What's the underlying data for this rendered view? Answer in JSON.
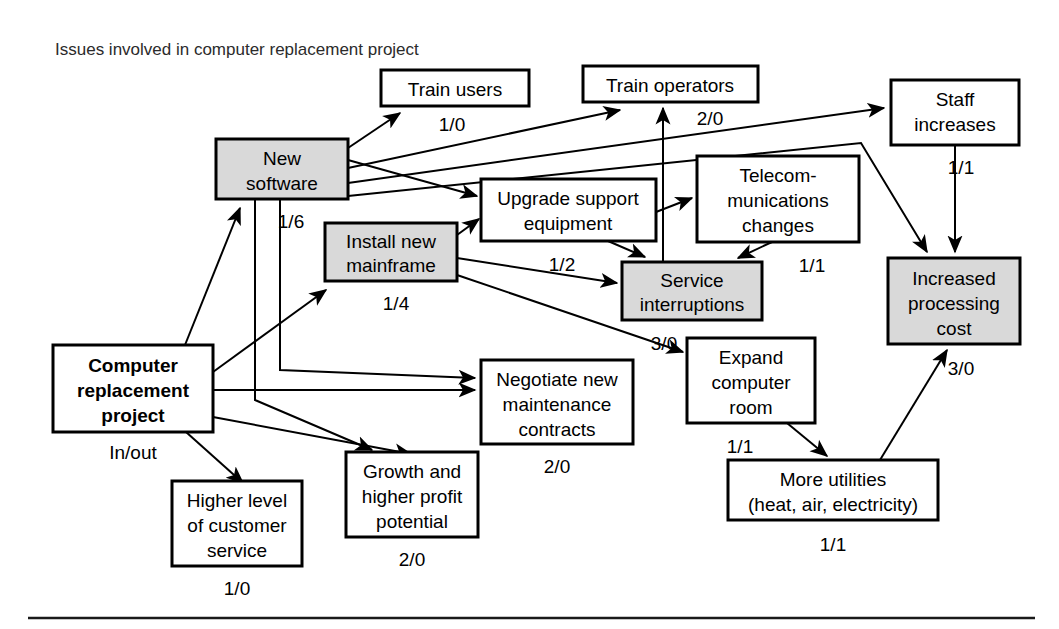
{
  "figure": {
    "title": "Issues involved in computer replacement project",
    "colors": {
      "shaded_fill": "#d9d9d9",
      "plain_fill": "#ffffff",
      "stroke": "#000000",
      "title_color": "#2b2b2b"
    }
  },
  "nodes": [
    {
      "id": "train-users",
      "lines": [
        "Train users"
      ],
      "io": "1/0",
      "shaded": false,
      "bold": false,
      "x": 381,
      "y": 70,
      "w": 148,
      "h": 36,
      "io_x": 452,
      "io_y": 131
    },
    {
      "id": "train-operators",
      "lines": [
        "Train operators"
      ],
      "io": "2/0",
      "shaded": false,
      "bold": false,
      "x": 583,
      "y": 66,
      "w": 175,
      "h": 36,
      "io_x": 710,
      "io_y": 125
    },
    {
      "id": "staff-increases",
      "lines": [
        "Staff",
        "increases"
      ],
      "io": "1/1",
      "shaded": false,
      "bold": false,
      "x": 891,
      "y": 80,
      "w": 128,
      "h": 65,
      "io_x": 961,
      "io_y": 174
    },
    {
      "id": "new-software",
      "lines": [
        "New",
        "software"
      ],
      "io": "1/6",
      "shaded": true,
      "bold": false,
      "x": 216,
      "y": 139,
      "w": 132,
      "h": 60,
      "io_x": 291,
      "io_y": 228
    },
    {
      "id": "upgrade-support-equipment",
      "lines": [
        "Upgrade support",
        "equipment"
      ],
      "io": "1/2",
      "shaded": false,
      "bold": false,
      "x": 481,
      "y": 179,
      "w": 175,
      "h": 62,
      "io_x": 562,
      "io_y": 271
    },
    {
      "id": "telecommunications-changes",
      "lines": [
        "Telecom-",
        "munications",
        "changes"
      ],
      "io": "1/1",
      "shaded": false,
      "bold": false,
      "x": 697,
      "y": 156,
      "w": 162,
      "h": 86,
      "io_x": 812,
      "io_y": 272
    },
    {
      "id": "install-new-mainframe",
      "lines": [
        "Install new",
        "mainframe"
      ],
      "io": "1/4",
      "shaded": true,
      "bold": false,
      "x": 325,
      "y": 223,
      "w": 132,
      "h": 58,
      "io_x": 396,
      "io_y": 310
    },
    {
      "id": "service-interruptions",
      "lines": [
        "Service",
        "interruptions"
      ],
      "io": "3/0",
      "shaded": true,
      "bold": false,
      "x": 622,
      "y": 262,
      "w": 140,
      "h": 58,
      "io_x": 664,
      "io_y": 350
    },
    {
      "id": "increased-processing-cost",
      "lines": [
        "Increased",
        "processing",
        "cost"
      ],
      "io": "3/0",
      "shaded": true,
      "bold": false,
      "x": 888,
      "y": 258,
      "w": 132,
      "h": 86,
      "io_x": 961,
      "io_y": 375
    },
    {
      "id": "computer-replacement-project",
      "lines": [
        "Computer",
        "replacement",
        "project"
      ],
      "io": "In/out",
      "shaded": false,
      "bold": true,
      "x": 53,
      "y": 345,
      "w": 160,
      "h": 87,
      "io_x": 133,
      "io_y": 459
    },
    {
      "id": "negotiate-maintenance-contracts",
      "lines": [
        "Negotiate new",
        "maintenance",
        "contracts"
      ],
      "io": "2/0",
      "shaded": false,
      "bold": false,
      "x": 481,
      "y": 360,
      "w": 152,
      "h": 84,
      "io_x": 557,
      "io_y": 473
    },
    {
      "id": "expand-computer-room",
      "lines": [
        "Expand",
        "computer",
        "room"
      ],
      "io": "1/1",
      "shaded": false,
      "bold": false,
      "x": 687,
      "y": 338,
      "w": 128,
      "h": 85,
      "io_x": 740,
      "io_y": 453
    },
    {
      "id": "more-utilities",
      "lines": [
        "More utilities",
        "(heat, air, electricity)"
      ],
      "io": "1/1",
      "shaded": false,
      "bold": false,
      "x": 728,
      "y": 460,
      "w": 210,
      "h": 60,
      "io_x": 833,
      "io_y": 551
    },
    {
      "id": "higher-level-customer-service",
      "lines": [
        "Higher level",
        "of customer",
        "service"
      ],
      "io": "1/0",
      "shaded": false,
      "bold": false,
      "x": 172,
      "y": 481,
      "w": 130,
      "h": 85,
      "io_x": 237,
      "io_y": 595
    },
    {
      "id": "growth-higher-profit",
      "lines": [
        "Growth and",
        "higher profit",
        "potential"
      ],
      "io": "2/0",
      "shaded": false,
      "bold": false,
      "x": 346,
      "y": 452,
      "w": 132,
      "h": 85,
      "io_x": 412,
      "io_y": 566
    }
  ],
  "edges": [
    {
      "id": "crp-to-new-software",
      "from": "computer-replacement-project",
      "to": "new-software"
    },
    {
      "id": "crp-to-install-mainframe",
      "from": "computer-replacement-project",
      "to": "install-new-mainframe"
    },
    {
      "id": "crp-to-negotiate",
      "from": "computer-replacement-project",
      "to": "negotiate-maintenance-contracts"
    },
    {
      "id": "crp-to-higher-service",
      "from": "computer-replacement-project",
      "to": "higher-level-customer-service"
    },
    {
      "id": "crp-to-growth",
      "from": "computer-replacement-project",
      "to": "growth-higher-profit"
    },
    {
      "id": "new-software-to-train-users",
      "from": "new-software",
      "to": "train-users"
    },
    {
      "id": "new-software-to-train-operators",
      "from": "new-software",
      "to": "train-operators"
    },
    {
      "id": "new-software-to-staff-increases",
      "from": "new-software",
      "to": "staff-increases"
    },
    {
      "id": "new-software-to-increased-cost",
      "from": "new-software",
      "to": "increased-processing-cost"
    },
    {
      "id": "new-software-to-upgrade-support",
      "from": "new-software",
      "to": "upgrade-support-equipment"
    },
    {
      "id": "new-software-to-negotiate",
      "from": "new-software",
      "to": "negotiate-maintenance-contracts"
    },
    {
      "id": "new-software-to-growth",
      "from": "new-software",
      "to": "growth-higher-profit"
    },
    {
      "id": "install-mainframe-to-upgrade-support",
      "from": "install-new-mainframe",
      "to": "upgrade-support-equipment"
    },
    {
      "id": "install-mainframe-to-service-interruptions",
      "from": "install-new-mainframe",
      "to": "service-interruptions"
    },
    {
      "id": "install-mainframe-to-expand-room",
      "from": "install-new-mainframe",
      "to": "expand-computer-room"
    },
    {
      "id": "install-mainframe-to-train-operators",
      "from": "install-new-mainframe",
      "to": "train-operators"
    },
    {
      "id": "upgrade-support-to-telecom",
      "from": "upgrade-support-equipment",
      "to": "telecommunications-changes"
    },
    {
      "id": "upgrade-support-to-service-interruptions",
      "from": "upgrade-support-equipment",
      "to": "service-interruptions"
    },
    {
      "id": "telecom-to-service-interruptions",
      "from": "telecommunications-changes",
      "to": "service-interruptions"
    },
    {
      "id": "staff-increases-to-increased-cost",
      "from": "staff-increases",
      "to": "increased-processing-cost"
    },
    {
      "id": "expand-room-to-more-utilities",
      "from": "expand-computer-room",
      "to": "more-utilities"
    },
    {
      "id": "more-utilities-to-increased-cost",
      "from": "more-utilities",
      "to": "increased-processing-cost"
    }
  ]
}
